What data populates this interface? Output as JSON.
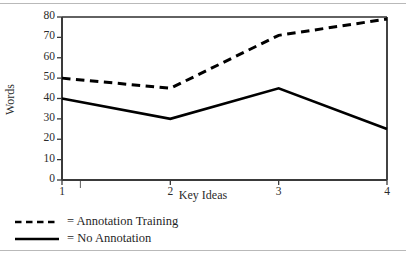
{
  "figure": {
    "kind": "line-chart",
    "rules": [
      "top-rule",
      "bottom-rule"
    ]
  },
  "chart_data": {
    "type": "line",
    "title": "",
    "xlabel": "Key Ideas",
    "ylabel": "Words",
    "categories": [
      "1",
      "2",
      "3",
      "4"
    ],
    "x": [
      1,
      2,
      3,
      4
    ],
    "xlim": [
      1,
      4
    ],
    "ylim": [
      0,
      80
    ],
    "ytick_labels": [
      "0",
      "10",
      "20",
      "30",
      "40",
      "50",
      "60",
      "70",
      "80"
    ],
    "yticks": [
      0,
      10,
      20,
      30,
      40,
      50,
      60,
      70,
      80
    ],
    "xtick_labels": [
      "1",
      "2",
      "3",
      "4"
    ],
    "grid": false,
    "legend_position": "below-axes-left",
    "series": [
      {
        "name": "Annotation Training",
        "legend_label": "= Annotation Training",
        "style": "dashed",
        "color": "#000000",
        "values": [
          50,
          45,
          71,
          79
        ]
      },
      {
        "name": "No Annotation",
        "legend_label": "= No Annotation",
        "style": "solid",
        "color": "#000000",
        "values": [
          40,
          30,
          45,
          25
        ]
      }
    ],
    "annotations": [
      {
        "name": "stray-minor-tick",
        "x": 1.17,
        "note": "small unlabeled tick mark on x-axis"
      }
    ]
  }
}
